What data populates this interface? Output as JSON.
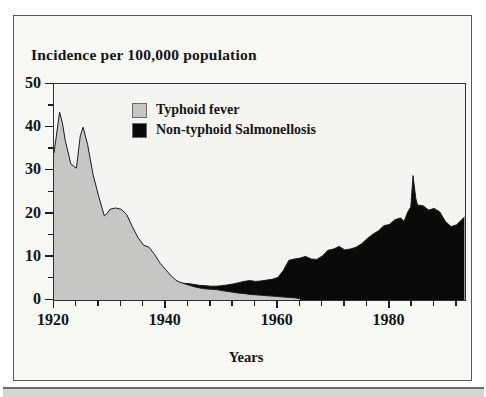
{
  "title": "Incidence per 100,000 population",
  "legend": {
    "items": [
      {
        "label": "Typhoid fever",
        "color": "#c6c6c3"
      },
      {
        "label": "Non-typhoid Salmonellosis",
        "color": "#0a0a0a"
      }
    ]
  },
  "axes": {
    "x_axis_title": "Years",
    "x_tick_labels": [
      "1920",
      "1940",
      "1960",
      "1980"
    ],
    "y_tick_labels": [
      "0",
      "10",
      "20",
      "30",
      "40",
      "50"
    ]
  },
  "colors": {
    "typhoid_fill": "#c6c6c3",
    "salmonellosis_fill": "#0a0a0a",
    "outline": "#1c1c1e"
  },
  "chart_data": {
    "type": "area",
    "title": "Incidence per 100,000 population",
    "xlabel": "Years",
    "ylabel": "Incidence per 100,000 population",
    "xlim": [
      1920,
      1993.5
    ],
    "ylim": [
      0,
      50
    ],
    "x_major_ticks": [
      1920,
      1940,
      1960,
      1980
    ],
    "x_minor_tick_step": 4,
    "y_major_ticks": [
      0,
      10,
      20,
      30,
      40,
      50
    ],
    "y_minor_tick_step": 5,
    "grid": false,
    "legend_position": "upper-left-inside",
    "series": [
      {
        "name": "Non-typhoid Salmonellosis",
        "color": "#0a0a0a",
        "z": "behind",
        "points": [
          [
            1942,
            3.9
          ],
          [
            1943,
            3.9
          ],
          [
            1944,
            3.8
          ],
          [
            1945,
            3.6
          ],
          [
            1946,
            3.4
          ],
          [
            1947,
            3.3
          ],
          [
            1948,
            3.2
          ],
          [
            1949,
            3.2
          ],
          [
            1950,
            3.3
          ],
          [
            1951,
            3.5
          ],
          [
            1952,
            3.7
          ],
          [
            1953,
            4.0
          ],
          [
            1954,
            4.3
          ],
          [
            1955,
            4.5
          ],
          [
            1956,
            4.3
          ],
          [
            1957,
            4.4
          ],
          [
            1958,
            4.6
          ],
          [
            1959,
            4.8
          ],
          [
            1960,
            5.2
          ],
          [
            1961,
            6.8
          ],
          [
            1962,
            9.2
          ],
          [
            1963,
            9.5
          ],
          [
            1964,
            9.7
          ],
          [
            1965,
            10.1
          ],
          [
            1966,
            9.5
          ],
          [
            1967,
            9.4
          ],
          [
            1968,
            10.2
          ],
          [
            1969,
            11.5
          ],
          [
            1970,
            11.8
          ],
          [
            1971,
            12.4
          ],
          [
            1972,
            11.6
          ],
          [
            1973,
            11.8
          ],
          [
            1974,
            12.2
          ],
          [
            1975,
            13.0
          ],
          [
            1976,
            14.2
          ],
          [
            1977,
            15.2
          ],
          [
            1978,
            16.0
          ],
          [
            1979,
            17.2
          ],
          [
            1980,
            17.5
          ],
          [
            1981,
            18.6
          ],
          [
            1982,
            19.0
          ],
          [
            1982.6,
            18.2
          ],
          [
            1983.3,
            20.5
          ],
          [
            1983.8,
            21.5
          ],
          [
            1984.2,
            28.8
          ],
          [
            1984.7,
            23.5
          ],
          [
            1985,
            22.0
          ],
          [
            1986,
            21.8
          ],
          [
            1987,
            20.8
          ],
          [
            1988,
            21.2
          ],
          [
            1989,
            20.4
          ],
          [
            1990,
            18.2
          ],
          [
            1991,
            17.0
          ],
          [
            1992,
            17.4
          ],
          [
            1993.4,
            19.2
          ]
        ]
      },
      {
        "name": "Typhoid fever",
        "color": "#c6c6c3",
        "z": "front",
        "points": [
          [
            1920,
            34
          ],
          [
            1921,
            43.5
          ],
          [
            1921.5,
            41
          ],
          [
            1922,
            37
          ],
          [
            1923,
            31.5
          ],
          [
            1924,
            30.5
          ],
          [
            1924.7,
            38
          ],
          [
            1925.2,
            40
          ],
          [
            1926,
            36
          ],
          [
            1927,
            29
          ],
          [
            1928,
            24
          ],
          [
            1929,
            19.5
          ],
          [
            1929.5,
            20
          ],
          [
            1930,
            21
          ],
          [
            1931,
            21.3
          ],
          [
            1932,
            21
          ],
          [
            1933,
            19.8
          ],
          [
            1934,
            17
          ],
          [
            1935,
            14.5
          ],
          [
            1936,
            12.7
          ],
          [
            1937,
            12.2
          ],
          [
            1938,
            10.5
          ],
          [
            1939,
            8.5
          ],
          [
            1940,
            7
          ],
          [
            1941,
            5.5
          ],
          [
            1942,
            4.4
          ],
          [
            1943,
            3.9
          ],
          [
            1944,
            3.5
          ],
          [
            1945,
            3.1
          ],
          [
            1946,
            2.8
          ],
          [
            1947,
            2.6
          ],
          [
            1948,
            2.5
          ],
          [
            1949,
            2.4
          ],
          [
            1950,
            2.2
          ],
          [
            1951,
            2.0
          ],
          [
            1952,
            1.8
          ],
          [
            1953,
            1.6
          ],
          [
            1954,
            1.5
          ],
          [
            1955,
            1.3
          ],
          [
            1956,
            1.2
          ],
          [
            1957,
            1.1
          ],
          [
            1958,
            1.0
          ],
          [
            1959,
            0.9
          ],
          [
            1960,
            0.8
          ],
          [
            1961,
            0.7
          ],
          [
            1962,
            0.6
          ],
          [
            1963,
            0.5
          ],
          [
            1964,
            0.3
          ]
        ]
      }
    ]
  }
}
